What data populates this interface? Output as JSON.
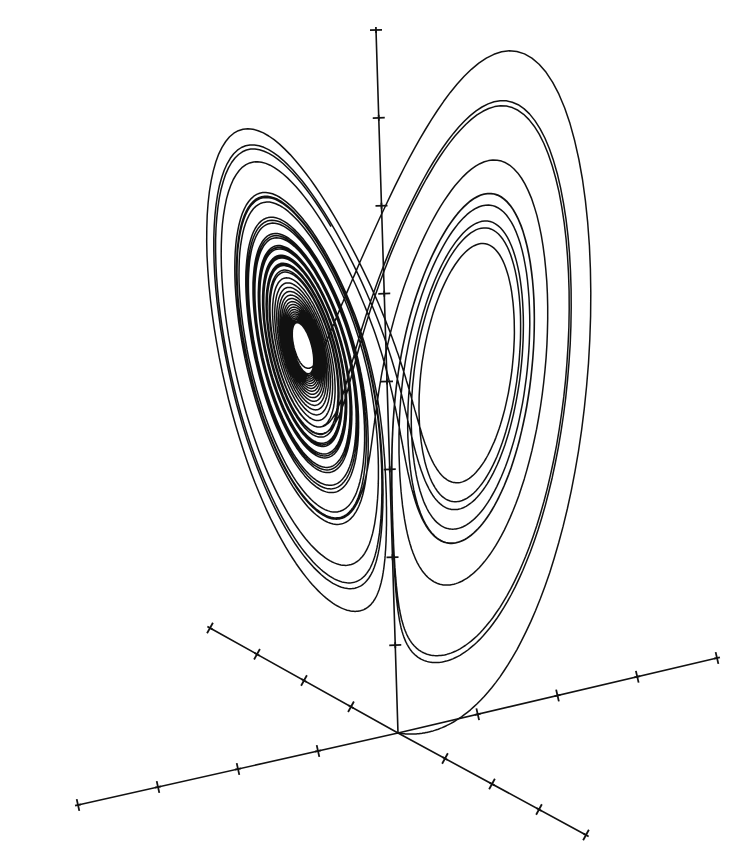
{
  "figure": {
    "title": "",
    "background": "#ffffff",
    "ink_color": "#111111"
  },
  "chart_data": {
    "type": "line",
    "title": "",
    "parameters": {
      "sigma": 10,
      "rho": 28,
      "beta": 2.6667
    },
    "axes": {
      "origin_px": [
        398,
        733
      ],
      "z_axis": {
        "end_px": [
          376,
          30
        ],
        "tick_count": 8
      },
      "x_axis": {
        "neg_end_px": [
          78,
          805
        ],
        "pos_end_px": [
          717,
          658
        ],
        "ticks_neg": 4,
        "ticks_pos": 4
      },
      "y_axis": {
        "neg_end_px": [
          210,
          628
        ],
        "pos_end_px": [
          586,
          835
        ],
        "ticks_neg": 4,
        "ticks_pos": 4
      }
    },
    "lobes": [
      {
        "name": "left",
        "center_px": [
          245,
          345
        ]
      },
      {
        "name": "right",
        "center_px": [
          530,
          360
        ]
      }
    ],
    "legend": [],
    "grid": false
  }
}
